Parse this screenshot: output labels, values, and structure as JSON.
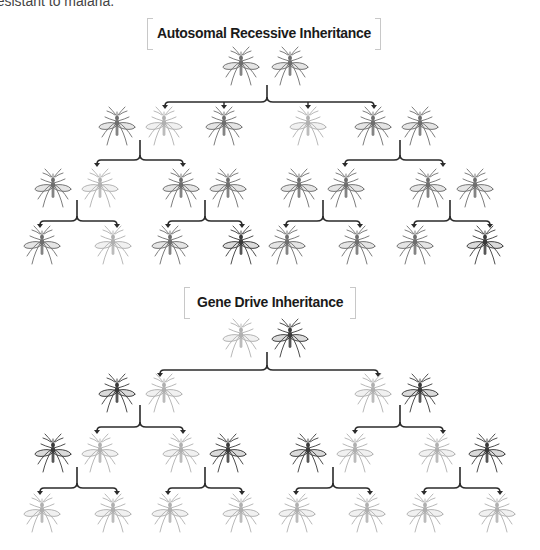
{
  "caption": "resistant to malaria.",
  "sections": [
    {
      "id": "autosomal",
      "title": "Autosomal Recessive Inheritance",
      "title_box": {
        "x": 147,
        "y": 18,
        "w": 234
      },
      "generations": [
        {
          "y": 68,
          "mosquitoes": [
            {
              "x": 241,
              "shade": "medium"
            },
            {
              "x": 290,
              "shade": "medium"
            }
          ]
        },
        {
          "y": 128,
          "mosquitoes": [
            {
              "x": 117,
              "shade": "medium"
            },
            {
              "x": 164,
              "shade": "light"
            },
            {
              "x": 224,
              "shade": "medium"
            },
            {
              "x": 308,
              "shade": "light"
            },
            {
              "x": 373,
              "shade": "medium"
            },
            {
              "x": 420,
              "shade": "medium"
            }
          ]
        },
        {
          "y": 190,
          "mosquitoes": [
            {
              "x": 53,
              "shade": "medium"
            },
            {
              "x": 100,
              "shade": "light"
            },
            {
              "x": 181,
              "shade": "medium"
            },
            {
              "x": 228,
              "shade": "medium"
            },
            {
              "x": 299,
              "shade": "medium"
            },
            {
              "x": 346,
              "shade": "medium"
            },
            {
              "x": 428,
              "shade": "medium"
            },
            {
              "x": 475,
              "shade": "medium"
            }
          ]
        },
        {
          "y": 247,
          "mosquitoes": [
            {
              "x": 42,
              "shade": "medium"
            },
            {
              "x": 113,
              "shade": "light"
            },
            {
              "x": 170,
              "shade": "medium"
            },
            {
              "x": 241,
              "shade": "dark"
            },
            {
              "x": 287,
              "shade": "medium"
            },
            {
              "x": 357,
              "shade": "medium"
            },
            {
              "x": 415,
              "shade": "medium"
            },
            {
              "x": 485,
              "shade": "dark"
            }
          ]
        }
      ],
      "brackets": [
        {
          "cx": 267,
          "top": 85,
          "y": 102,
          "arrows": [
            165,
            224,
            308,
            374
          ]
        },
        {
          "cx": 140,
          "top": 140,
          "y": 160,
          "arrows": [
            97,
            183
          ]
        },
        {
          "cx": 400,
          "top": 140,
          "y": 160,
          "arrows": [
            345,
            443
          ]
        },
        {
          "cx": 77,
          "top": 200,
          "y": 221,
          "arrows": [
            40,
            117
          ]
        },
        {
          "cx": 205,
          "top": 200,
          "y": 221,
          "arrows": [
            168,
            242
          ]
        },
        {
          "cx": 323,
          "top": 200,
          "y": 221,
          "arrows": [
            286,
            360
          ]
        },
        {
          "cx": 450,
          "top": 200,
          "y": 221,
          "arrows": [
            414,
            490
          ]
        }
      ]
    },
    {
      "id": "gene-drive",
      "title": "Gene Drive Inheritance",
      "title_box": {
        "x": 184,
        "y": 287,
        "w": 172
      },
      "generations": [
        {
          "y": 340,
          "mosquitoes": [
            {
              "x": 241,
              "shade": "light"
            },
            {
              "x": 290,
              "shade": "dark"
            }
          ]
        },
        {
          "y": 395,
          "mosquitoes": [
            {
              "x": 117,
              "shade": "dark"
            },
            {
              "x": 164,
              "shade": "light"
            },
            {
              "x": 373,
              "shade": "light"
            },
            {
              "x": 420,
              "shade": "dark"
            }
          ]
        },
        {
          "y": 455,
          "mosquitoes": [
            {
              "x": 53,
              "shade": "dark"
            },
            {
              "x": 100,
              "shade": "light"
            },
            {
              "x": 181,
              "shade": "light"
            },
            {
              "x": 228,
              "shade": "dark"
            },
            {
              "x": 308,
              "shade": "dark"
            },
            {
              "x": 355,
              "shade": "light"
            },
            {
              "x": 437,
              "shade": "light"
            },
            {
              "x": 487,
              "shade": "dark"
            }
          ]
        },
        {
          "y": 515,
          "mosquitoes": [
            {
              "x": 42,
              "shade": "light"
            },
            {
              "x": 113,
              "shade": "light"
            },
            {
              "x": 170,
              "shade": "light"
            },
            {
              "x": 241,
              "shade": "light"
            },
            {
              "x": 297,
              "shade": "light"
            },
            {
              "x": 367,
              "shade": "light"
            },
            {
              "x": 425,
              "shade": "light"
            },
            {
              "x": 497,
              "shade": "light"
            }
          ]
        }
      ],
      "brackets": [
        {
          "cx": 267,
          "top": 352,
          "y": 370,
          "arrows": [
            160,
            378
          ]
        },
        {
          "cx": 140,
          "top": 405,
          "y": 427,
          "arrows": [
            97,
            183
          ]
        },
        {
          "cx": 400,
          "top": 405,
          "y": 427,
          "arrows": [
            355,
            443
          ]
        },
        {
          "cx": 77,
          "top": 467,
          "y": 488,
          "arrows": [
            40,
            117
          ]
        },
        {
          "cx": 205,
          "top": 467,
          "y": 488,
          "arrows": [
            168,
            242
          ]
        },
        {
          "cx": 333,
          "top": 467,
          "y": 488,
          "arrows": [
            296,
            370
          ]
        },
        {
          "cx": 460,
          "top": 467,
          "y": 488,
          "arrows": [
            424,
            500
          ]
        }
      ]
    }
  ],
  "shade_colors": {
    "dark": "#3a3a3a",
    "medium": "#6e6e6e",
    "light": "#b0b0b0"
  },
  "line_color": "#2b2b2b"
}
